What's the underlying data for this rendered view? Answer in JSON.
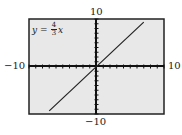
{
  "chart_data": {
    "type": "line",
    "title": "",
    "annotation": "y = 4/3 x",
    "equation": {
      "lhs": "y",
      "eq": "=",
      "num": "4",
      "den": "3",
      "var": "x"
    },
    "series": [
      {
        "name": "y = 4/3 x",
        "x": [
          -7.0,
          7.0
        ],
        "values": [
          -9.33,
          9.33
        ]
      }
    ],
    "xlim": [
      -10,
      10
    ],
    "ylim": [
      -10,
      10
    ],
    "tick_labels": {
      "x_min": "−10",
      "x_max": "10",
      "y_min": "−10",
      "y_max": "10"
    },
    "ticks": "every 1 unit",
    "grid": false,
    "background": "#e8e8e8",
    "line_color": "#222222"
  }
}
